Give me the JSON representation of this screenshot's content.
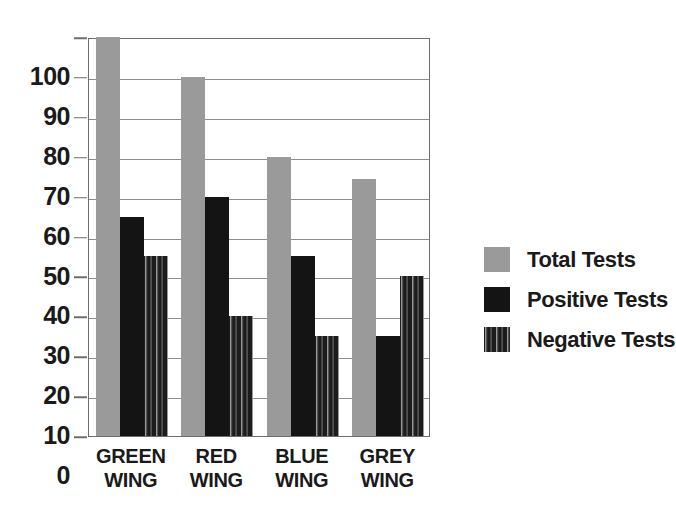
{
  "chart_data": {
    "type": "bar",
    "title": "",
    "subtitle": "",
    "xlabel": "",
    "ylabel": "",
    "categories": [
      "GREEN WING",
      "RED WING",
      "BLUE WING",
      "GREY WING"
    ],
    "category_lines": [
      [
        "GREEN",
        "WING"
      ],
      [
        "RED",
        "WING"
      ],
      [
        "BLUE",
        "WING"
      ],
      [
        "GREY",
        "WING"
      ]
    ],
    "series": [
      {
        "name": "Total Tests",
        "color": "#9a9a9a",
        "values": [
          100,
          90,
          70,
          64.5
        ]
      },
      {
        "name": "Positive Tests",
        "color": "#141414",
        "values": [
          55,
          60,
          45,
          25
        ]
      },
      {
        "name": "Negative Tests",
        "color": "#1c1c1c",
        "values": [
          45,
          30,
          25,
          40
        ]
      }
    ],
    "ylim": [
      0,
      100
    ],
    "ytick_step": 10,
    "yticks": [
      100,
      90,
      80,
      70,
      60,
      50,
      40,
      30,
      20,
      10,
      0
    ],
    "ytick_labels": [
      "100",
      "90",
      "80",
      "70",
      "60",
      "50",
      "40",
      "30",
      "20",
      "10",
      "0"
    ],
    "grid": true,
    "grid_axis": "y",
    "legend_position": "right",
    "legend": [
      "Total Tests",
      "Positive Tests",
      "Negative Tests"
    ],
    "annotations": []
  },
  "colors": {
    "total": "#9a9a9a",
    "positive": "#141414",
    "negative": "#1c1c1c",
    "axis": "#6e6e6e",
    "grid": "#8c8c8c",
    "text": "#1a1a1a",
    "background": "#ffffff"
  }
}
